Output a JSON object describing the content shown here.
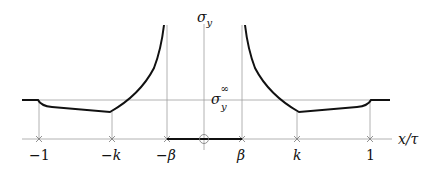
{
  "diagram": {
    "type": "stress distribution plot",
    "y_axis_label": "σ",
    "y_axis_sub": "y",
    "x_axis_label": "x/τ",
    "reference_level_label": "σ",
    "reference_level_sub": "y",
    "reference_level_sup": "∞",
    "ticks": [
      {
        "label": "−1"
      },
      {
        "label": "−k"
      },
      {
        "label": "−β"
      },
      {
        "label": "β"
      },
      {
        "label": "k"
      },
      {
        "label": "1"
      }
    ],
    "origin_marker": "circled-plus",
    "colors": {
      "curve": "#111111",
      "grid": "#9a9a9a",
      "text": "#111111"
    }
  }
}
